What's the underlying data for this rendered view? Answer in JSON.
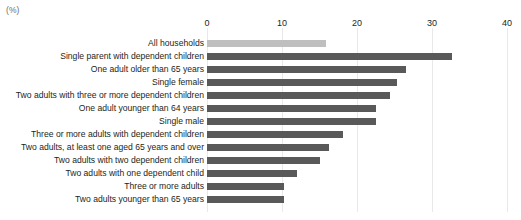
{
  "unit_label": "(%)",
  "chart_data": {
    "type": "bar",
    "orientation": "horizontal",
    "title": "",
    "subtitle": "",
    "xlabel": "(%)",
    "ylabel": "",
    "xlim": [
      0,
      40
    ],
    "xticks": [
      0,
      10,
      20,
      30,
      40
    ],
    "xtick_labels": [
      "0",
      "10",
      "20",
      "30",
      "40"
    ],
    "grid": true,
    "grid_axis": "x",
    "legend": false,
    "legend_position": "none",
    "colors": {
      "bar": "#595959",
      "bar_highlight": "#bfbfbf",
      "gridline": "#e9e9ea",
      "text": "#231f20",
      "unit_text": "#6d6e71"
    },
    "categories": [
      "All households",
      "Single parent with dependent children",
      "One adult older than 65 years",
      "Single female",
      "Two adults with three or more dependent children",
      "One adult younger than 64 years",
      "Single male",
      "Three or more adults with dependent children",
      "Two adults, at least one aged 65 years and over",
      "Two adults with two dependent children",
      "Two adults with one dependent child",
      "Three or more adults",
      "Two adults younger than 65 years"
    ],
    "values": [
      15.9,
      32.7,
      26.5,
      25.3,
      24.4,
      22.5,
      22.5,
      18.1,
      16.2,
      15.0,
      12.0,
      10.2,
      10.2
    ],
    "highlight_index": 0
  }
}
